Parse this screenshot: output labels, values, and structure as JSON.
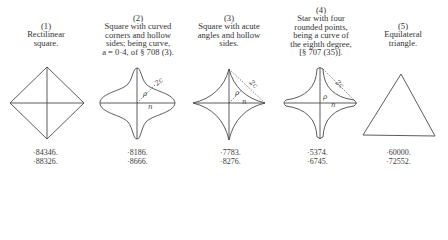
{
  "figures": [
    {
      "number": "(1)",
      "caption_lines": [
        "Rectilinear",
        "square."
      ],
      "values": [
        "·84346.",
        "·88326."
      ],
      "shape": "rectilinear-square"
    },
    {
      "number": "(2)",
      "caption_lines": [
        "Square with curved",
        "corners and hollow",
        "sides; being curve,",
        "a = 0·4, of § 708 (3)."
      ],
      "values": [
        "·8186.",
        "·8666."
      ],
      "shape": "curved-square",
      "labels": {
        "rho": "ρ",
        "n": "n",
        "c": "2c"
      }
    },
    {
      "number": "(3)",
      "caption_lines": [
        "Square with acute",
        "angles and hollow",
        "sides."
      ],
      "values": [
        "·7783.",
        "·8276."
      ],
      "shape": "acute-hollow-square",
      "labels": {
        "rho": "ρ",
        "n": "n",
        "c": "2c"
      }
    },
    {
      "number": "(4)",
      "caption_lines": [
        "Star with four",
        "rounded points,",
        "being a curve of",
        "the eighth degree,",
        "[§ 707 (35)]."
      ],
      "values": [
        "·5374.",
        "·6745."
      ],
      "shape": "four-point-star",
      "labels": {
        "rho": "ρ",
        "n": "n",
        "c": "2c"
      }
    },
    {
      "number": "(5)",
      "caption_lines": [
        "Equilateral",
        "triangle."
      ],
      "values": [
        "·60000.",
        "·72552."
      ],
      "shape": "equilateral-triangle"
    }
  ],
  "colors": {
    "ink": "#3a3a3a",
    "background": "#ffffff"
  }
}
